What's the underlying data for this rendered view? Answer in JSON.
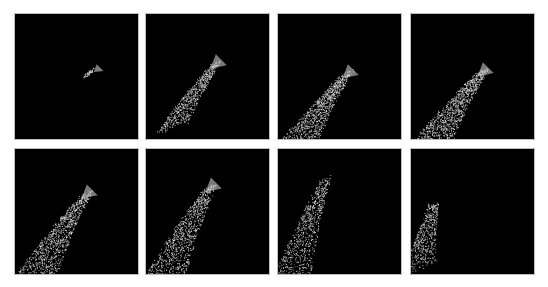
{
  "figure": {
    "layout": {
      "rows": 2,
      "cols": 4
    },
    "background_color": "#000000",
    "particle_color": "#e6e6e6",
    "panels": [
      {
        "id": 1,
        "x": 14,
        "y": 13,
        "head": [
          88,
          56
        ],
        "spread": 0.08,
        "length": 0.08,
        "count": 60
      },
      {
        "id": 2,
        "x": 145,
        "y": 13,
        "head": [
          80,
          50
        ],
        "spread": 0.55,
        "length": 0.75,
        "count": 700
      },
      {
        "id": 3,
        "x": 277,
        "y": 13,
        "head": [
          80,
          60
        ],
        "spread": 0.75,
        "length": 1.0,
        "count": 1100
      },
      {
        "id": 4,
        "x": 410,
        "y": 13,
        "head": [
          82,
          58
        ],
        "spread": 0.8,
        "length": 1.0,
        "count": 1200
      },
      {
        "id": 5,
        "x": 14,
        "y": 148,
        "head": [
          82,
          45
        ],
        "spread": 0.8,
        "length": 1.0,
        "count": 1200
      },
      {
        "id": 6,
        "x": 145,
        "y": 148,
        "head": [
          75,
          38
        ],
        "spread": 0.75,
        "length": 1.0,
        "count": 1100
      },
      {
        "id": 7,
        "x": 277,
        "y": 148,
        "head": [
          58,
          30
        ],
        "spread": 0.6,
        "length": 1.0,
        "count": 900
      },
      {
        "id": 8,
        "x": 410,
        "y": 148,
        "head": [
          33,
          55
        ],
        "spread": 0.5,
        "length": 0.8,
        "count": 550
      }
    ]
  }
}
